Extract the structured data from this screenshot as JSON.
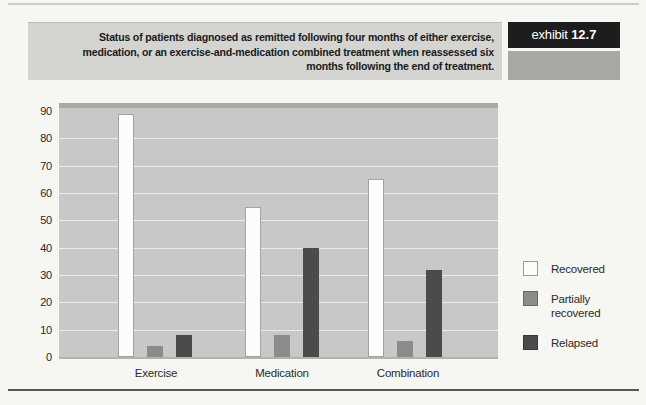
{
  "header": {
    "title_lines": [
      "Status of patients diagnosed as remitted following four months of either exercise,",
      "medication, or an exercise-and-medication combined treatment when reassessed six",
      "months following the end of treatment."
    ]
  },
  "exhibit": {
    "label": "exhibit",
    "number": "12.7"
  },
  "colors": {
    "header_bg": "#d4d4d1",
    "exhibit_bg": "#1d1d1d",
    "exhibit_text": "#ffffff",
    "exhibit_sub_bg": "#a8a8a5",
    "plot_bg": "#c8c8c6",
    "plot_top_edge": "#a9a9a6",
    "gridline": "#ececea"
  },
  "chart_data": {
    "type": "bar",
    "title": "",
    "xlabel": "",
    "ylabel": "",
    "categories": [
      "Exercise",
      "Medication",
      "Combination"
    ],
    "series": [
      {
        "name": "Recovered",
        "values": [
          89,
          55,
          65
        ],
        "color": "#fcfcfa"
      },
      {
        "name": "Partially recovered",
        "values": [
          4,
          8,
          6
        ],
        "color": "#8b8b8b"
      },
      {
        "name": "Relapsed",
        "values": [
          8,
          40,
          32
        ],
        "color": "#4b4b4b"
      }
    ],
    "ylim": [
      0,
      90
    ],
    "yticks": [
      0,
      10,
      20,
      30,
      40,
      50,
      60,
      70,
      80,
      90
    ],
    "grid": "horizontal",
    "legend_position": "right"
  }
}
